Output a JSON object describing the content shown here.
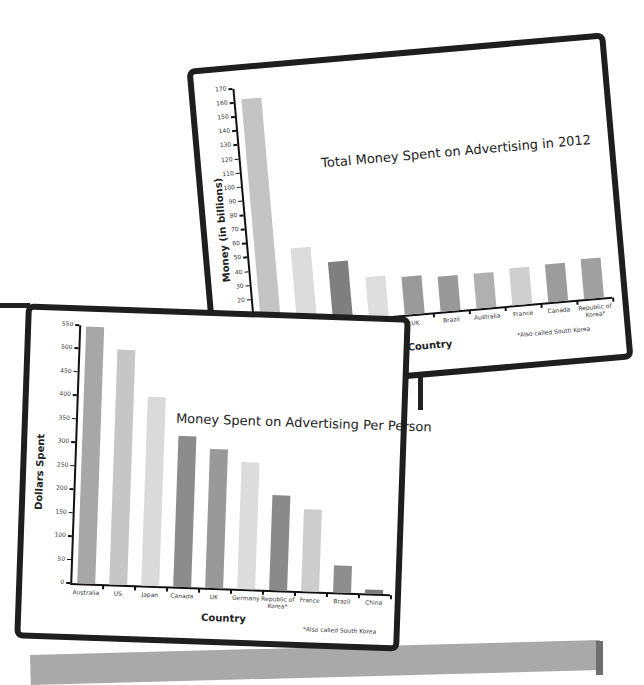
{
  "chart_data": [
    {
      "type": "bar",
      "title": "Total Money  Spent on Advertising in 2012",
      "xlabel": "Country",
      "ylabel": "Money (in billions)",
      "categories": [
        "US",
        "Japan",
        "China",
        "Germany",
        "UK",
        "Brazil",
        "Australia",
        "France",
        "Canada",
        "Republic of Korea*"
      ],
      "values": [
        162,
        54,
        42,
        29,
        27,
        25,
        25,
        26,
        27,
        28
      ],
      "colors": [
        "#c4c4c4",
        "#dcdcdc",
        "#7f7f7f",
        "#dedede",
        "#9a9a9a",
        "#999999",
        "#b0b0b0",
        "#cfcfcf",
        "#9c9c9c",
        "#a0a0a0"
      ],
      "ylim": [
        0,
        170
      ],
      "yticks": [
        0,
        10,
        20,
        30,
        40,
        50,
        60,
        70,
        80,
        90,
        100,
        110,
        120,
        130,
        140,
        150,
        160,
        170
      ],
      "grid": false,
      "annotation": "*Also called South Korea"
    },
    {
      "type": "bar",
      "title": "Money Spent on Advertising Per Person",
      "xlabel": "Country",
      "ylabel": "Dollars Spent",
      "categories": [
        "Australia",
        "US",
        "Japan",
        "Canada",
        "UK",
        "Germany",
        "Republic of Korea*",
        "France",
        "Brazil",
        "China"
      ],
      "values": [
        548,
        500,
        402,
        322,
        297,
        270,
        202,
        175,
        57,
        8
      ],
      "colors": [
        "#a7a7a7",
        "#c6c6c6",
        "#dadada",
        "#8c8c8c",
        "#999999",
        "#dcdcdc",
        "#8a8a8a",
        "#cdcdcd",
        "#8e8e8e",
        "#7b7b7b"
      ],
      "ylim": [
        0,
        550
      ],
      "yticks": [
        0,
        50,
        100,
        150,
        200,
        250,
        300,
        350,
        400,
        450,
        500,
        550
      ],
      "grid": false,
      "annotation": "*Also called South Korea"
    }
  ]
}
